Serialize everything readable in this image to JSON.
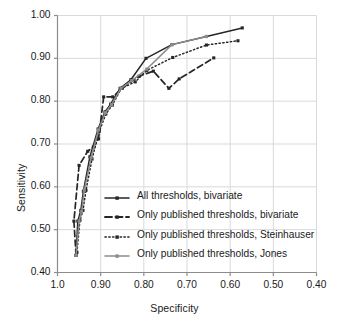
{
  "chart_data": {
    "type": "line",
    "title": "",
    "xlabel": "Specificity",
    "ylabel": "Sensitivity",
    "xlim": [
      1.0,
      0.4
    ],
    "ylim": [
      0.4,
      1.0
    ],
    "x_reversed": true,
    "grid": true,
    "legend_position": "inside-lower-center",
    "xticks": [
      "1.0",
      "0.90",
      "0.80",
      "0.70",
      "0.60",
      "0.50",
      "0.40"
    ],
    "xtick_values": [
      1.0,
      0.9,
      0.8,
      0.7,
      0.6,
      0.5,
      0.4
    ],
    "yticks": [
      "0.40",
      "0.50",
      "0.60",
      "0.70",
      "0.80",
      "0.90",
      "1.00"
    ],
    "ytick_values": [
      0.4,
      0.5,
      0.6,
      0.7,
      0.8,
      0.9,
      1.0
    ],
    "series": [
      {
        "name": "All thresholds, bivariate",
        "style": "solid",
        "color": "#262626",
        "marker": "square",
        "points": [
          [
            0.957,
            0.44
          ],
          [
            0.953,
            0.52
          ],
          [
            0.946,
            0.545
          ],
          [
            0.94,
            0.59
          ],
          [
            0.925,
            0.67
          ],
          [
            0.906,
            0.735
          ],
          [
            0.89,
            0.775
          ],
          [
            0.877,
            0.793
          ],
          [
            0.855,
            0.83
          ],
          [
            0.83,
            0.85
          ],
          [
            0.795,
            0.9
          ],
          [
            0.735,
            0.932
          ],
          [
            0.655,
            0.951
          ],
          [
            0.572,
            0.971
          ]
        ]
      },
      {
        "name": "Only published thresholds, bivariate",
        "style": "dashed",
        "color": "#262626",
        "marker": "square",
        "points": [
          [
            0.957,
            0.44
          ],
          [
            0.962,
            0.52
          ],
          [
            0.95,
            0.65
          ],
          [
            0.93,
            0.683
          ],
          [
            0.917,
            0.693
          ],
          [
            0.905,
            0.712
          ],
          [
            0.893,
            0.81
          ],
          [
            0.872,
            0.81
          ],
          [
            0.85,
            0.83
          ],
          [
            0.812,
            0.858
          ],
          [
            0.778,
            0.87
          ],
          [
            0.742,
            0.83
          ],
          [
            0.718,
            0.852
          ],
          [
            0.638,
            0.901
          ]
        ]
      },
      {
        "name": "Only published thresholds, Steinhauser",
        "style": "dotted",
        "color": "#262626",
        "marker": "square",
        "points": [
          [
            0.955,
            0.447
          ],
          [
            0.948,
            0.522
          ],
          [
            0.941,
            0.545
          ],
          [
            0.934,
            0.592
          ],
          [
            0.92,
            0.665
          ],
          [
            0.903,
            0.73
          ],
          [
            0.888,
            0.77
          ],
          [
            0.873,
            0.791
          ],
          [
            0.852,
            0.83
          ],
          [
            0.82,
            0.845
          ],
          [
            0.793,
            0.872
          ],
          [
            0.733,
            0.902
          ],
          [
            0.655,
            0.931
          ],
          [
            0.582,
            0.941
          ]
        ]
      },
      {
        "name": "Only published thresholds, Jones",
        "style": "solid",
        "color": "#8c8c8c",
        "marker": "square",
        "points": [
          [
            0.957,
            0.44
          ],
          [
            0.95,
            0.52
          ],
          [
            0.944,
            0.543
          ],
          [
            0.938,
            0.592
          ],
          [
            0.922,
            0.668
          ],
          [
            0.905,
            0.733
          ],
          [
            0.889,
            0.773
          ],
          [
            0.875,
            0.792
          ],
          [
            0.853,
            0.83
          ],
          [
            0.828,
            0.848
          ],
          [
            0.793,
            0.875
          ],
          [
            0.735,
            0.932
          ],
          [
            0.655,
            0.951
          ]
        ]
      }
    ]
  },
  "legend": {
    "items": [
      {
        "label": "All thresholds, bivariate",
        "style": "solid",
        "color": "#262626"
      },
      {
        "label": "Only published thresholds, bivariate",
        "style": "dashed",
        "color": "#262626"
      },
      {
        "label": "Only published thresholds, Steinhauser",
        "style": "dotted",
        "color": "#262626"
      },
      {
        "label": "Only published thresholds, Jones",
        "style": "solid",
        "color": "#8c8c8c"
      }
    ]
  },
  "colors": {
    "grid": "#d9d9d9",
    "axis": "#8c8c8c",
    "text": "#1a1a1a",
    "series_dark": "#262626",
    "series_gray": "#8c8c8c",
    "background": "#ffffff"
  }
}
